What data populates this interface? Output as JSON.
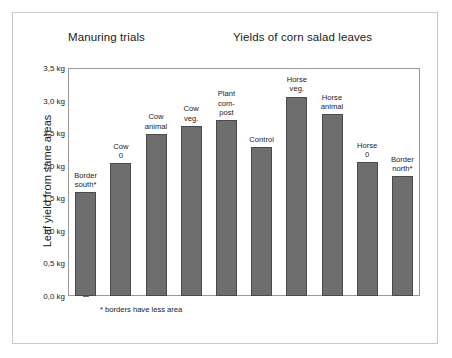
{
  "figure": {
    "title_left": "Manuring trials",
    "title_right": "Yields of corn salad leaves",
    "footnote": "* borders have less area",
    "bar_color": "#6e6e6e",
    "bar_outline_color": "#4a4a4a",
    "frame_color": "#9a9a9a",
    "outer_frame_color": "#c9c9c9",
    "background": "#ffffff"
  },
  "chart_data": {
    "type": "bar",
    "xlabel": "",
    "ylabel": "Leaf yield from same areas",
    "ylim": [
      0.0,
      3.5
    ],
    "ytick_labels": [
      "0,0 kg",
      "0,5 kg",
      "1,0 kg",
      "1,5 kg",
      "2,0 kg",
      "2,5 kg",
      "3,0 kg",
      "3,5 kg"
    ],
    "ytick_values": [
      0.0,
      0.5,
      1.0,
      1.5,
      2.0,
      2.5,
      3.0,
      3.5
    ],
    "minor_ticks_per_interval": 4,
    "grid": false,
    "legend": "none",
    "unit": "kg",
    "categories": [
      "Border south*",
      "Cow 0",
      "Cow animal",
      "Cow veg.",
      "Plant com-post",
      "Control",
      "Horse veg.",
      "Horse animal",
      "Horse 0",
      "Border north*"
    ],
    "category_lines": [
      [
        "Border",
        "south*"
      ],
      [
        "Cow",
        "0"
      ],
      [
        "Cow",
        "animal"
      ],
      [
        "Cow",
        "veg."
      ],
      [
        "Plant",
        "com-",
        "post"
      ],
      [
        "Control"
      ],
      [
        "Horse",
        "veg."
      ],
      [
        "Horse",
        "animal"
      ],
      [
        "Horse",
        "0"
      ],
      [
        "Border",
        "north*"
      ]
    ],
    "values": [
      1.59,
      2.04,
      2.49,
      2.61,
      2.7,
      2.28,
      3.06,
      2.79,
      2.05,
      1.84
    ],
    "annotations": [
      "* borders have less area"
    ]
  }
}
